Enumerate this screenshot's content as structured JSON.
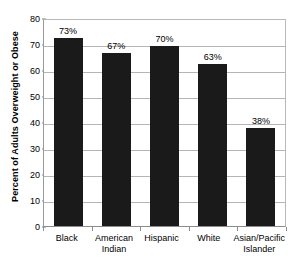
{
  "chart_data": {
    "type": "bar",
    "title": "",
    "xlabel": "",
    "ylabel": "Percent of Adults Overweight or Obese",
    "ylim": [
      0,
      80
    ],
    "ytick_step": 10,
    "yticks": [
      "80",
      "70",
      "60",
      "50",
      "40",
      "30",
      "20",
      "10",
      "0"
    ],
    "grid": true,
    "legend": "none",
    "categories": [
      "Black",
      "American Indian",
      "Hispanic",
      "White",
      "Asian/Pacific Islander"
    ],
    "values": [
      73,
      67,
      70,
      63,
      38
    ],
    "data_labels": [
      "73%",
      "67%",
      "70%",
      "63%",
      "38%"
    ],
    "bar_color": "#1a1a1a",
    "background_color": "#ffffff",
    "gridline_color": "#b5b5b5",
    "axis_color": "#8d8d8d"
  }
}
